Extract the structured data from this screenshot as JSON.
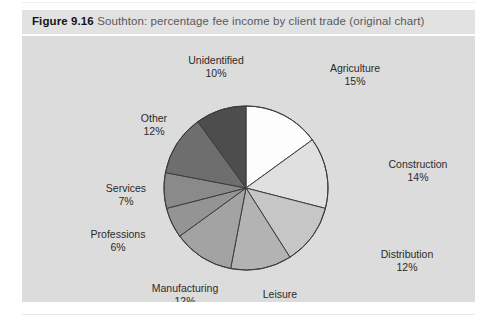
{
  "figure": {
    "label": "Figure 9.16",
    "caption": "Southton: percentage fee income by client trade (original chart)"
  },
  "chart_data": {
    "type": "pie",
    "title": "Southton: percentage fee income by client trade (original chart)",
    "xlabel": "",
    "ylabel": "",
    "unit": "%",
    "start_angle_deg": 0,
    "direction": "clockwise",
    "legend": "none (direct labels with leader position)",
    "grid": false,
    "total": 100,
    "categories": [
      "Agriculture",
      "Construction",
      "Distribution",
      "Leisure",
      "Manufacturing",
      "Professions",
      "Services",
      "Other",
      "Unidentified"
    ],
    "values": [
      15,
      14,
      12,
      12,
      12,
      6,
      7,
      12,
      10
    ],
    "slices": [
      {
        "name": "Agriculture",
        "value": 15,
        "label": "Agriculture",
        "pct": "15%",
        "color": "#fdfdfd"
      },
      {
        "name": "Construction",
        "value": 14,
        "label": "Construction",
        "pct": "14%",
        "color": "#e0e0e0"
      },
      {
        "name": "Distribution",
        "value": 12,
        "label": "Distribution",
        "pct": "12%",
        "color": "#c6c6c6"
      },
      {
        "name": "Leisure",
        "value": 12,
        "label": "Leisure",
        "pct": "12%",
        "color": "#b3b3b3"
      },
      {
        "name": "Manufacturing",
        "value": 12,
        "label": "Manufacturing",
        "pct": "12%",
        "color": "#a3a3a3"
      },
      {
        "name": "Professions",
        "value": 6,
        "label": "Professions",
        "pct": "6%",
        "color": "#949494"
      },
      {
        "name": "Services",
        "value": 7,
        "label": "Services",
        "pct": "7%",
        "color": "#8a8a8a"
      },
      {
        "name": "Other",
        "value": 12,
        "label": "Other",
        "pct": "12%",
        "color": "#6e6e6e"
      },
      {
        "name": "Unidentified",
        "value": 10,
        "label": "Unidentified",
        "pct": "10%",
        "color": "#4d4d4d"
      }
    ]
  },
  "colors": {
    "page_background": "#ffffff",
    "caption_bar": "#e2e2e2",
    "chart_background": "#dcdcdc",
    "slice_outline": "#3c3c3c",
    "text": "#2b2b2b",
    "caption_label": "#141414",
    "caption_body": "#595959"
  }
}
